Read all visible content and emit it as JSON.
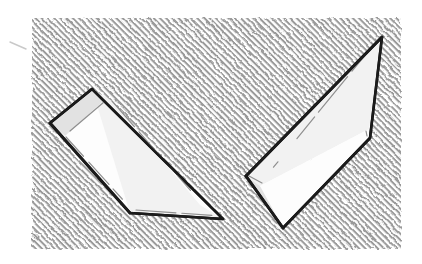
{
  "figure": {
    "caption": "",
    "canvas": {
      "width": 422,
      "height": 264
    },
    "background_color": "#ffffff",
    "hatch": {
      "name": "diagonal-pen-hatching",
      "color": "#9a9a9a",
      "direction": "backslash",
      "angle_degrees": 135,
      "line_width": 2.0,
      "spacing": 4.4,
      "panel": {
        "x": 32,
        "y": 18,
        "width": 369,
        "height": 231
      }
    },
    "ink": {
      "outline_color": "#111111",
      "detail_color": "#8f8f8f",
      "face_light": "#fdfdfd",
      "face_mid": "#f2f2f2",
      "face_shadow": "#e2e2e2",
      "stroke_width": 2.6,
      "detail_width": 1.2
    },
    "objects": [
      {
        "name": "left-wedge",
        "label": "Wedge pointing down-right",
        "orientation": "apex-lower-right",
        "outline": "92,89 50,123 130,213 223,219",
        "top_face": "92,89 130,213 223,219 200,205 112,101",
        "end_face": "92,89 50,123 65,136 103,101",
        "side_face": "50,123 65,136 133,213 130,213",
        "detail_lines": [
          "112,101 205,207",
          "66,137 134,212",
          "104,102 70,131",
          "136,210 221,216"
        ]
      },
      {
        "name": "right-wedge",
        "label": "Wedge pointing up-right",
        "orientation": "apex-upper-right",
        "outline": "382,37 246,176 283,228 370,138",
        "top_face": "382,37 246,176 260,186 369,129",
        "end_face": "246,176 283,228 296,216 260,186",
        "side_face": "369,129 260,186 283,228 370,138",
        "detail_lines": [
          "371,48 263,180",
          "296,216 368,140",
          "262,183 249,176",
          "366,131 367,136"
        ]
      }
    ],
    "stray_mark": {
      "name": "pencil-tick",
      "path": "10,42 26,49",
      "color": "#c9c9c9"
    }
  }
}
